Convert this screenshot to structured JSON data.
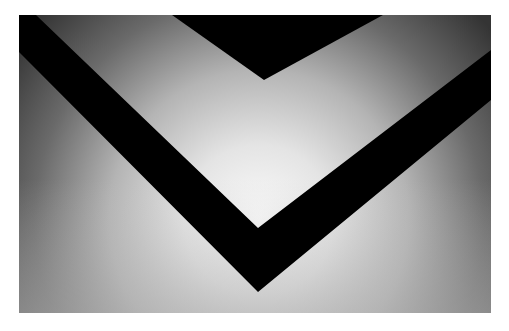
{
  "image": {
    "subject": "abstract-black-chevron-on-gradient",
    "description": "Abstract photograph: a large black V-shaped band and an inverted black triangle over a gray radial gradient that brightens toward the center",
    "frame": {
      "x": 19,
      "y": 15,
      "width": 472,
      "height": 298,
      "border_color": "#ffffff"
    },
    "colors": {
      "shape": "#050505",
      "highlight": "#fbfbfb",
      "mid": "#cfcfcf",
      "edge_bottom": "#b4b4b4",
      "dark_top_left": "#3c3c3c",
      "dark_top_right": "#2e2e2e"
    },
    "shapes": {
      "top_triangle": [
        [
          153,
          0
        ],
        [
          364,
          0
        ],
        [
          245,
          65
        ]
      ],
      "chevron_band": [
        [
          0,
          37
        ],
        [
          0,
          0
        ],
        [
          17,
          0
        ],
        [
          239,
          213
        ],
        [
          472,
          35
        ],
        [
          472,
          85
        ],
        [
          239,
          277
        ]
      ]
    }
  }
}
